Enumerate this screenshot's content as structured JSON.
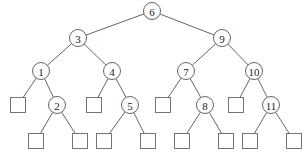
{
  "diagram": {
    "type": "binary-search-tree",
    "nodes": [
      {
        "id": "n6",
        "label": "6",
        "x": 152,
        "y": 11
      },
      {
        "id": "n3",
        "label": "3",
        "x": 78,
        "y": 38
      },
      {
        "id": "n9",
        "label": "9",
        "x": 222,
        "y": 38
      },
      {
        "id": "n1",
        "label": "1",
        "x": 41,
        "y": 71
      },
      {
        "id": "n4",
        "label": "4",
        "x": 112,
        "y": 71
      },
      {
        "id": "n7",
        "label": "7",
        "x": 186,
        "y": 71
      },
      {
        "id": "n10",
        "label": "10",
        "x": 254,
        "y": 71
      },
      {
        "id": "n2",
        "label": "2",
        "x": 57,
        "y": 105
      },
      {
        "id": "n5",
        "label": "5",
        "x": 130,
        "y": 105
      },
      {
        "id": "n8",
        "label": "8",
        "x": 205,
        "y": 105
      },
      {
        "id": "n11",
        "label": "11",
        "x": 271,
        "y": 105
      }
    ],
    "leaves": [
      {
        "id": "l1",
        "x": 18,
        "y": 105
      },
      {
        "id": "l2",
        "x": 94,
        "y": 105
      },
      {
        "id": "l3",
        "x": 163,
        "y": 105
      },
      {
        "id": "l4",
        "x": 236,
        "y": 105
      },
      {
        "id": "l5",
        "x": 36,
        "y": 141
      },
      {
        "id": "l6",
        "x": 80,
        "y": 141
      },
      {
        "id": "l7",
        "x": 104,
        "y": 141
      },
      {
        "id": "l8",
        "x": 148,
        "y": 141
      },
      {
        "id": "l9",
        "x": 182,
        "y": 141
      },
      {
        "id": "l10",
        "x": 226,
        "y": 141
      },
      {
        "id": "l11",
        "x": 250,
        "y": 141
      },
      {
        "id": "l12",
        "x": 294,
        "y": 141
      }
    ],
    "edges": [
      [
        "n6",
        "n3"
      ],
      [
        "n6",
        "n9"
      ],
      [
        "n3",
        "n1"
      ],
      [
        "n3",
        "n4"
      ],
      [
        "n9",
        "n7"
      ],
      [
        "n9",
        "n10"
      ],
      [
        "n1",
        "l1"
      ],
      [
        "n1",
        "n2"
      ],
      [
        "n4",
        "l2"
      ],
      [
        "n4",
        "n5"
      ],
      [
        "n7",
        "l3"
      ],
      [
        "n7",
        "n8"
      ],
      [
        "n10",
        "l4"
      ],
      [
        "n10",
        "n11"
      ],
      [
        "n2",
        "l5"
      ],
      [
        "n2",
        "l6"
      ],
      [
        "n5",
        "l7"
      ],
      [
        "n5",
        "l8"
      ],
      [
        "n8",
        "l9"
      ],
      [
        "n8",
        "l10"
      ],
      [
        "n11",
        "l11"
      ],
      [
        "n11",
        "l12"
      ]
    ]
  }
}
